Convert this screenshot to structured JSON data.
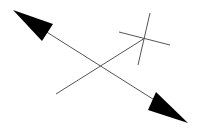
{
  "diagram": {
    "background": "#ffffff",
    "stroke_color": "#555555",
    "fill_color": "#000000",
    "double_arrow": {
      "line": {
        "x1": 45,
        "y1": 31,
        "x2": 156,
        "y2": 101
      },
      "head_start": {
        "points": "13,10 53,24 42,41"
      },
      "head_end": {
        "points": "188,123 156,92 148,110"
      }
    },
    "diagonal_line": {
      "x1": 56,
      "y1": 94,
      "x2": 145,
      "y2": 38
    },
    "cross": {
      "horizontal": {
        "x1": 119,
        "y1": 32,
        "x2": 170,
        "y2": 45
      },
      "vertical": {
        "x1": 150,
        "y1": 13,
        "x2": 138,
        "y2": 65
      }
    }
  }
}
